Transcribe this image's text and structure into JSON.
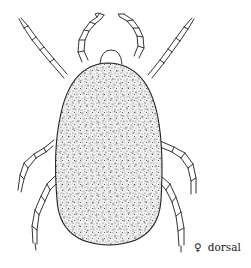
{
  "figure": {
    "view": "dorsal",
    "sex_symbol": "♀",
    "caption": "dorsal",
    "colors": {
      "ink": "#333333",
      "background": "#ffffff",
      "stipple": "#555555"
    }
  }
}
